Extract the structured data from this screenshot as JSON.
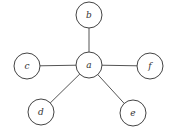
{
  "diagram": {
    "type": "star-graph",
    "center": "a",
    "nodes": [
      {
        "id": "a",
        "label": "a",
        "x": 89,
        "y": 65
      },
      {
        "id": "b",
        "label": "b",
        "x": 89,
        "y": 15
      },
      {
        "id": "c",
        "label": "c",
        "x": 27,
        "y": 66
      },
      {
        "id": "f",
        "label": "f",
        "x": 150,
        "y": 66
      },
      {
        "id": "d",
        "label": "d",
        "x": 41,
        "y": 112
      },
      {
        "id": "e",
        "label": "e",
        "x": 133,
        "y": 113
      }
    ],
    "edges": [
      {
        "from": "a",
        "to": "b"
      },
      {
        "from": "a",
        "to": "c"
      },
      {
        "from": "a",
        "to": "f"
      },
      {
        "from": "a",
        "to": "d"
      },
      {
        "from": "a",
        "to": "e"
      }
    ],
    "node_radius": 13,
    "colors": {
      "stroke": "#444444",
      "fill": "#ffffff",
      "text": "#333333"
    }
  }
}
